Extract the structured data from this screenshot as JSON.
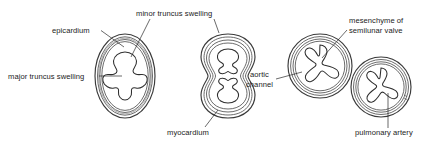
{
  "figure": {
    "domain_type": "anatomical-line-diagram",
    "title": "",
    "background_color": "#ffffff",
    "ink_color": "#2e2e2e",
    "wall_fill_color": "#e9e8e6",
    "lumen_fill_color": "#ffffff",
    "label_color": "#1b1b1b",
    "label_font_size_px": 7.6
  },
  "labels": [
    {
      "id": "epicardium",
      "text": "epicardium",
      "x": 52,
      "y": 33,
      "anchor": "start",
      "leader": "M101,34 L124,47"
    },
    {
      "id": "minor-truncus-swelling",
      "text": "minor truncus swelling",
      "x": 136,
      "y": 16,
      "anchor": "start",
      "leader": "M148,19 L131,55",
      "leader2": "M210,19 L214,33"
    },
    {
      "id": "major-truncus-swelling",
      "text": "major truncus swelling",
      "x": 8,
      "y": 79,
      "anchor": "start",
      "leader": "M99,76 L122,76"
    },
    {
      "id": "myocardium",
      "text": "myocardium",
      "x": 167,
      "y": 135,
      "anchor": "start",
      "leader": "M198,128 L217,112"
    },
    {
      "id": "aortic-channel-line1",
      "text": "aortic",
      "x": 250,
      "y": 77,
      "anchor": "start",
      "leader": "M277,80 L300,73"
    },
    {
      "id": "aortic-channel-line2",
      "text": "channel",
      "x": 246,
      "y": 87,
      "anchor": "start",
      "leader": ""
    },
    {
      "id": "mesenchyme-line1",
      "text": "mesenchyme of",
      "x": 349,
      "y": 23,
      "anchor": "start",
      "leader": ""
    },
    {
      "id": "mesenchyme-line2",
      "text": "semilunar valve",
      "x": 349,
      "y": 33,
      "anchor": "start",
      "leader": "M346,30 L320,57"
    },
    {
      "id": "pulmonary-artery",
      "text": "pulmonary artery",
      "x": 355,
      "y": 135,
      "anchor": "start",
      "leader": "M388,128 L388,94"
    }
  ],
  "panels": [
    {
      "id": "panel-1-single-truncus",
      "description": "oval truncus with four-lobed lumen",
      "shape": "oval",
      "lumen_lobes": 4,
      "center_x": 125,
      "center_y": 76
    },
    {
      "id": "panel-2-dividing-truncus",
      "description": "figure-eight truncus with two three-lobed lumens",
      "shape": "figure-eight",
      "lumen_lobes": 3,
      "lumen_count": 2,
      "center_x": 228,
      "center_y": 76
    },
    {
      "id": "panel-3-separated-vessels",
      "description": "two separated circular vessels each with trefoil semilunar valve lumen",
      "shape": "twin-circles",
      "lumen_lobes": 3,
      "lumen_count": 2,
      "center_x": 350,
      "center_y": 76
    }
  ]
}
